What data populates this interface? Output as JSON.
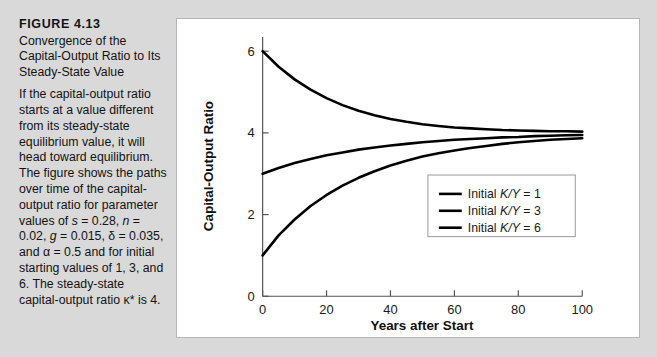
{
  "figure": {
    "number": "FIGURE  4.13",
    "title": "Convergence of the Capital-Output Ratio to Its Steady-State Value",
    "body_text": "If the capital-output ratio starts at a value different from its steady-state equilibrium value, it will head toward equilibrium. The figure shows the paths over time of the capital-output ratio for parameter values of s = 0.28, n = 0.02, g = 0.015, δ = 0.035, and α = 0.5 and for initial starting values of 1, 3, and 6. The steady-state capital-output ratio κ* is 4.",
    "background_color": "#d9d9d9",
    "panel_color": "#ffffff"
  },
  "chart_data": {
    "type": "line",
    "title": "",
    "xlabel": "Years after Start",
    "ylabel": "Capital-Output Ratio",
    "xlim": [
      0,
      100
    ],
    "ylim": [
      0,
      6.35
    ],
    "xticks": [
      0,
      20,
      40,
      60,
      80,
      100
    ],
    "yticks": [
      0,
      2,
      4,
      6
    ],
    "xtick_labels": [
      "0",
      "20",
      "40",
      "60",
      "80",
      "100"
    ],
    "ytick_labels": [
      "0",
      "2",
      "4",
      "6"
    ],
    "grid": false,
    "legend_position": "center-right",
    "steady_state": 4,
    "line_color": "#000000",
    "series": [
      {
        "name": "Initial K/Y = 1",
        "initial_value": 1,
        "x": [
          0,
          5,
          10,
          15,
          20,
          25,
          30,
          35,
          40,
          45,
          50,
          55,
          60,
          65,
          70,
          75,
          80,
          85,
          90,
          95,
          100
        ],
        "values": [
          1.0,
          1.49,
          1.88,
          2.21,
          2.48,
          2.71,
          2.9,
          3.06,
          3.2,
          3.32,
          3.42,
          3.5,
          3.57,
          3.63,
          3.68,
          3.73,
          3.77,
          3.8,
          3.83,
          3.85,
          3.87
        ]
      },
      {
        "name": "Initial K/Y = 3",
        "initial_value": 3,
        "x": [
          0,
          5,
          10,
          15,
          20,
          25,
          30,
          35,
          40,
          45,
          50,
          55,
          60,
          65,
          70,
          75,
          80,
          85,
          90,
          95,
          100
        ],
        "values": [
          3.0,
          3.14,
          3.26,
          3.36,
          3.45,
          3.52,
          3.59,
          3.64,
          3.69,
          3.73,
          3.77,
          3.8,
          3.83,
          3.85,
          3.87,
          3.89,
          3.9,
          3.92,
          3.93,
          3.94,
          3.95
        ]
      },
      {
        "name": "Initial K/Y = 6",
        "initial_value": 6,
        "x": [
          0,
          5,
          10,
          15,
          20,
          25,
          30,
          35,
          40,
          45,
          50,
          55,
          60,
          65,
          70,
          75,
          80,
          85,
          90,
          95,
          100
        ],
        "values": [
          6.0,
          5.62,
          5.31,
          5.06,
          4.85,
          4.68,
          4.54,
          4.43,
          4.34,
          4.27,
          4.21,
          4.17,
          4.13,
          4.11,
          4.09,
          4.07,
          4.06,
          4.05,
          4.04,
          4.04,
          4.03
        ]
      }
    ],
    "legend_entries": [
      {
        "prefix": "Initial ",
        "symbol": "K/Y",
        "suffix": " = 1"
      },
      {
        "prefix": "Initial ",
        "symbol": "K/Y",
        "suffix": " = 3"
      },
      {
        "prefix": "Initial ",
        "symbol": "K/Y",
        "suffix": " = 6"
      }
    ]
  }
}
